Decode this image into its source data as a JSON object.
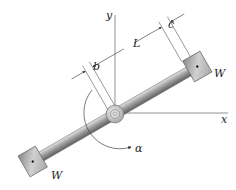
{
  "diagram": {
    "axes": {
      "x_label": "x",
      "y_label": "y"
    },
    "weights": [
      {
        "id": "upper",
        "label": "W"
      },
      {
        "id": "lower",
        "label": "W"
      }
    ],
    "dimensions": {
      "b": "b",
      "L": "L",
      "c": "c"
    },
    "angle_label": "α",
    "colors": {
      "line": "#555555",
      "rod_light": "#d8d8d8",
      "rod_dark": "#6e6e6e",
      "weight_fill": "#bdbdbd",
      "background": "#ffffff"
    }
  }
}
